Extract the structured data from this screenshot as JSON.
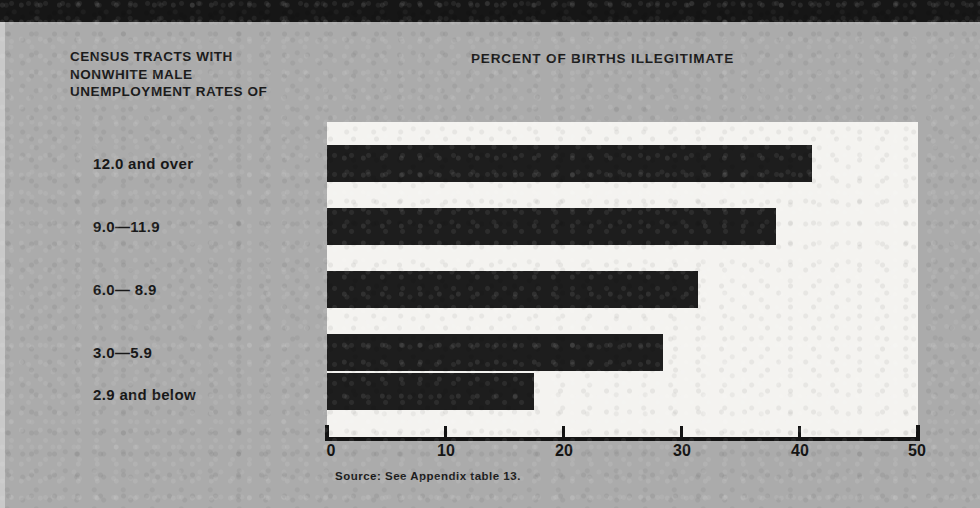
{
  "row_header": "CENSUS TRACTS WITH NONWHITE MALE UNEMPLOYMENT RATES OF",
  "row_header_lines": [
    "CENSUS TRACTS WITH",
    "NONWHITE MALE",
    "UNEMPLOYMENT RATES OF"
  ],
  "chart_title": "PERCENT OF BIRTHS ILLEGITIMATE",
  "source_note": "Source: See Appendix table 13.",
  "colors": {
    "paper": "#ababab",
    "plot_background": "#f4f3f0",
    "bar": "#1d1d1d",
    "axis": "#141414",
    "text": "#181818",
    "top_band": "#161616"
  },
  "chart_data": {
    "type": "bar",
    "orientation": "horizontal",
    "title": "PERCENT OF BIRTHS ILLEGITIMATE",
    "xlabel": "",
    "ylabel": "CENSUS TRACTS WITH NONWHITE MALE UNEMPLOYMENT RATES OF",
    "categories": [
      "12.0 and over",
      "9.0—11.9",
      "6.0— 8.9",
      "3.0—5.9",
      "2.9 and below"
    ],
    "values": [
      41.0,
      38.0,
      31.4,
      28.4,
      17.5
    ],
    "xlim": [
      0,
      50
    ],
    "xticks": [
      0,
      10,
      20,
      30,
      40,
      50
    ],
    "xtick_labels": [
      "0",
      "10",
      "20",
      "30",
      "40",
      "50"
    ],
    "grid": false,
    "legend": false,
    "source": "Source: See Appendix table 13."
  }
}
